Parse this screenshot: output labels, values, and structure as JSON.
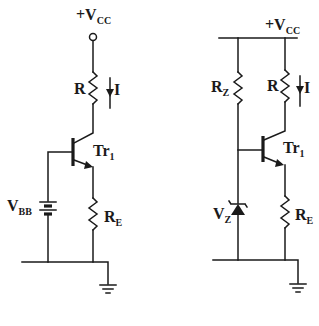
{
  "circuits": [
    {
      "id": "left",
      "supply": {
        "label": "+V",
        "sub": "CC"
      },
      "resistor": {
        "label": "R"
      },
      "current": {
        "label": "I"
      },
      "transistor": {
        "label": "Tr",
        "sub": "1"
      },
      "base_source": {
        "label": "V",
        "sub": "BB"
      },
      "emitter_resistor": {
        "label": "R",
        "sub": "E"
      }
    },
    {
      "id": "right",
      "supply": {
        "label": "+V",
        "sub": "CC"
      },
      "zener_resistor": {
        "label": "R",
        "sub": "Z"
      },
      "resistor": {
        "label": "R"
      },
      "current": {
        "label": "I"
      },
      "transistor": {
        "label": "Tr",
        "sub": "1"
      },
      "zener": {
        "label": "V",
        "sub": "Z"
      },
      "emitter_resistor": {
        "label": "R",
        "sub": "E"
      }
    }
  ]
}
